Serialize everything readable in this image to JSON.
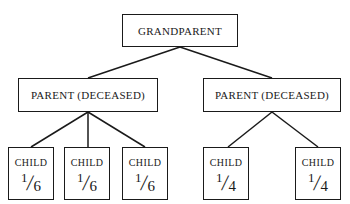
{
  "diagram": {
    "type": "family-tree",
    "grandparent": {
      "label": "GRANDPARENT"
    },
    "parents": [
      {
        "label": "PARENT (DECEASED)",
        "children": [
          {
            "label": "CHILD",
            "share_numerator": "1",
            "share_denominator": "6",
            "share": "1/6"
          },
          {
            "label": "CHILD",
            "share_numerator": "1",
            "share_denominator": "6",
            "share": "1/6"
          },
          {
            "label": "CHILD",
            "share_numerator": "1",
            "share_denominator": "6",
            "share": "1/6"
          }
        ]
      },
      {
        "label": "PARENT (DECEASED)",
        "children": [
          {
            "label": "CHILD",
            "share_numerator": "1",
            "share_denominator": "4",
            "share": "1/4"
          },
          {
            "label": "CHILD",
            "share_numerator": "1",
            "share_denominator": "4",
            "share": "1/4"
          }
        ]
      }
    ],
    "edges": [
      [
        "GRANDPARENT",
        "PARENT (DECEASED) #1"
      ],
      [
        "GRANDPARENT",
        "PARENT (DECEASED) #2"
      ],
      [
        "PARENT (DECEASED) #1",
        "CHILD #1"
      ],
      [
        "PARENT (DECEASED) #1",
        "CHILD #2"
      ],
      [
        "PARENT (DECEASED) #1",
        "CHILD #3"
      ],
      [
        "PARENT (DECEASED) #2",
        "CHILD #4"
      ],
      [
        "PARENT (DECEASED) #2",
        "CHILD #5"
      ]
    ],
    "colors": {
      "line": "#1a1a1a",
      "background": "#ffffff"
    }
  }
}
